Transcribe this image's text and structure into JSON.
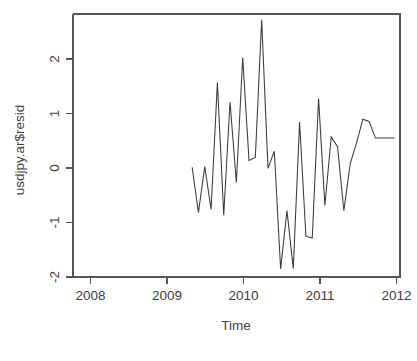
{
  "chart_data": {
    "type": "line",
    "title": "",
    "xlabel": "Time",
    "ylabel": "usdjpy.ar$resid",
    "xlim": [
      2007.68,
      2011.99
    ],
    "ylim": [
      -1.98,
      2.62
    ],
    "xticks": [
      2008,
      2009,
      2010,
      2011,
      2012
    ],
    "xtick_labels": [
      "2008",
      "2009",
      "2010",
      "2011",
      "2012"
    ],
    "yticks": [
      -2,
      -1,
      0,
      1,
      2
    ],
    "ytick_labels": [
      "-2",
      "-1",
      "0",
      "1",
      "2"
    ],
    "grid": false,
    "legend": false,
    "line_color": "#3a3a3a",
    "axis_color": "#555555",
    "background_color": "#ffffff",
    "series": [
      {
        "name": "usdjpy.ar$resid",
        "x": [
          2009.25,
          2009.3333,
          2009.4167,
          2009.5,
          2009.5833,
          2009.6667,
          2009.75,
          2009.8333,
          2009.9167,
          2010.0,
          2010.0833,
          2010.1667,
          2010.25,
          2010.3333,
          2010.4167,
          2010.5,
          2010.5833,
          2010.6667,
          2010.75,
          2010.8333,
          2010.9167,
          2011.0,
          2011.0833,
          2011.1667,
          2011.25,
          2011.3333,
          2011.4167,
          2011.5,
          2011.5833,
          2011.6667,
          2011.75,
          2011.8333,
          2011.9167
        ],
        "y": [
          -0.06,
          -0.85,
          -0.05,
          -0.8,
          1.42,
          -0.9,
          1.08,
          -0.33,
          1.86,
          0.06,
          0.11,
          2.52,
          -0.08,
          0.22,
          -1.84,
          -0.82,
          -1.83,
          0.73,
          -1.27,
          -1.3,
          1.14,
          -0.73,
          0.47,
          0.3,
          -0.82,
          0.0,
          0.36,
          0.78,
          0.74,
          0.45,
          0.45,
          0.45,
          0.45
        ]
      }
    ],
    "data_points_visible": [
      {
        "time": 2009.25,
        "value": -0.06
      },
      {
        "time": 2009.33,
        "value": -0.85
      },
      {
        "time": 2009.42,
        "value": -0.05
      },
      {
        "time": 2009.5,
        "value": -0.8
      },
      {
        "time": 2009.58,
        "value": 1.42
      },
      {
        "time": 2009.67,
        "value": -0.9
      },
      {
        "time": 2009.75,
        "value": 1.08
      },
      {
        "time": 2009.83,
        "value": -0.33
      },
      {
        "time": 2009.92,
        "value": 1.86
      },
      {
        "time": 2010.0,
        "value": 0.06
      },
      {
        "time": 2010.08,
        "value": 0.11
      },
      {
        "time": 2010.17,
        "value": 2.52
      },
      {
        "time": 2010.25,
        "value": -0.08
      },
      {
        "time": 2010.33,
        "value": 0.22
      },
      {
        "time": 2010.42,
        "value": -1.84
      },
      {
        "time": 2010.5,
        "value": -0.82
      },
      {
        "time": 2010.58,
        "value": -1.83
      },
      {
        "time": 2010.67,
        "value": 0.73
      },
      {
        "time": 2010.75,
        "value": -1.27
      },
      {
        "time": 2010.83,
        "value": -1.3
      },
      {
        "time": 2010.92,
        "value": 1.14
      },
      {
        "time": 2011.0,
        "value": -0.73
      },
      {
        "time": 2011.08,
        "value": 0.47
      },
      {
        "time": 2011.17,
        "value": 0.3
      },
      {
        "time": 2011.25,
        "value": -0.82
      },
      {
        "time": 2011.33,
        "value": 0.0
      },
      {
        "time": 2011.42,
        "value": 0.36
      },
      {
        "time": 2011.5,
        "value": 0.78
      },
      {
        "time": 2011.58,
        "value": 0.45
      }
    ]
  }
}
